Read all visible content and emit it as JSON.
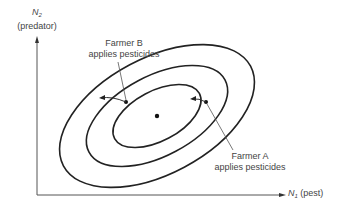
{
  "diagram": {
    "y_axis": {
      "symbol": "N",
      "subscript": "2",
      "label": "(predator)"
    },
    "x_axis": {
      "symbol": "N",
      "subscript": "1",
      "label": "(pest)"
    },
    "annotations": [
      {
        "id": "farmer_b",
        "line1": "Farmer B",
        "line2": "applies pesticides"
      },
      {
        "id": "farmer_a",
        "line1": "Farmer A",
        "line2": "applies pesticides"
      }
    ],
    "contours": 3,
    "colors": {
      "stroke": "#222222",
      "text": "#444444",
      "background": "#ffffff"
    }
  }
}
